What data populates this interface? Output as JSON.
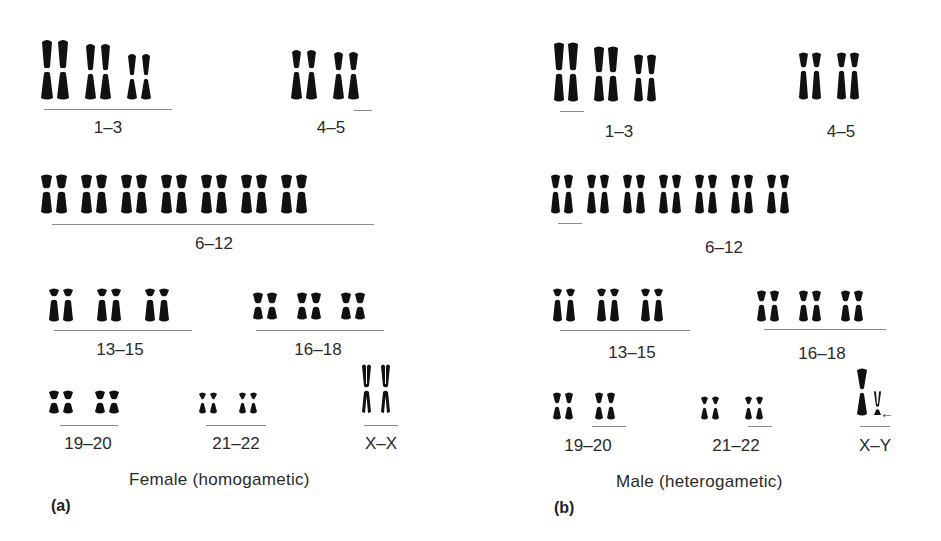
{
  "panels": [
    {
      "id": "a",
      "letter": "(a)",
      "caption": "Female (homogametic)",
      "groups": [
        {
          "label": "1–3",
          "pairs": 3
        },
        {
          "label": "4–5",
          "pairs": 2
        },
        {
          "label": "6–12",
          "pairs": 7
        },
        {
          "label": "13–15",
          "pairs": 3
        },
        {
          "label": "16–18",
          "pairs": 3
        },
        {
          "label": "19–20",
          "pairs": 2
        },
        {
          "label": "21–22",
          "pairs": 2
        },
        {
          "label": "X–X",
          "pairs": 1
        }
      ]
    },
    {
      "id": "b",
      "letter": "(b)",
      "caption": "Male (heterogametic)",
      "groups": [
        {
          "label": "1–3",
          "pairs": 3
        },
        {
          "label": "4–5",
          "pairs": 2
        },
        {
          "label": "6–12",
          "pairs": 7
        },
        {
          "label": "13–15",
          "pairs": 3
        },
        {
          "label": "16–18",
          "pairs": 3
        },
        {
          "label": "19–20",
          "pairs": 2
        },
        {
          "label": "21–22",
          "pairs": 2
        },
        {
          "label": "X–Y",
          "pairs": 1,
          "arrow": "←"
        }
      ]
    }
  ],
  "colors": {
    "chromosome": "#111111",
    "centromere": "#ffffff",
    "underline": "#8a8a8a",
    "text": "#2a2a2a"
  }
}
